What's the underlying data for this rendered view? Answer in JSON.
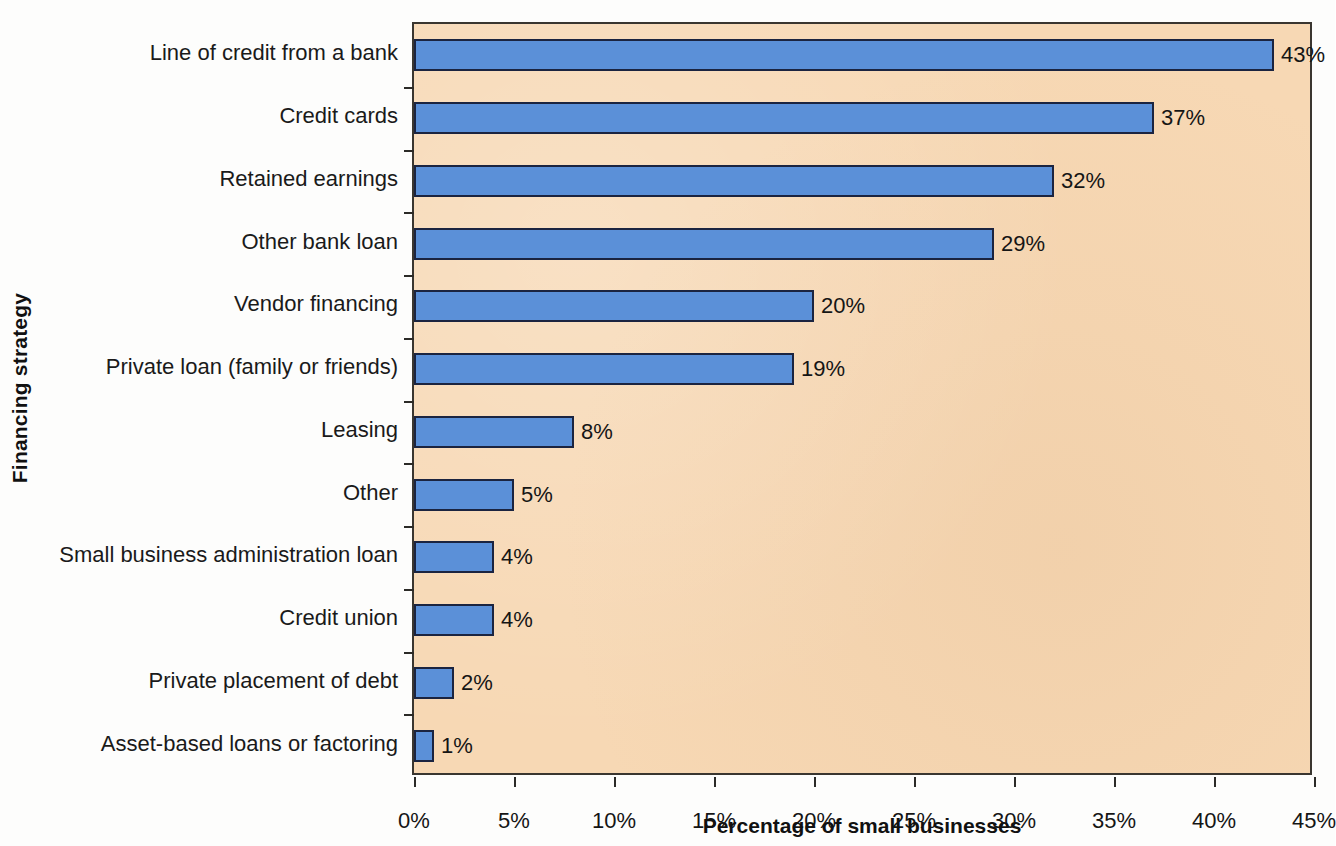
{
  "chart_data": {
    "type": "bar",
    "orientation": "horizontal",
    "title": "",
    "xlabel": "Percentage of small businesses",
    "ylabel": "Financing strategy",
    "categories": [
      "Line of credit from a bank",
      "Credit cards",
      "Retained earnings",
      "Other bank loan",
      "Vendor financing",
      "Private loan (family or friends)",
      "Leasing",
      "Other",
      "Small business administration loan",
      "Credit union",
      "Private placement of debt",
      "Asset-based loans or factoring"
    ],
    "values": [
      43,
      37,
      32,
      29,
      20,
      19,
      8,
      5,
      4,
      4,
      2,
      1
    ],
    "value_labels": [
      "43%",
      "37%",
      "32%",
      "29%",
      "20%",
      "19%",
      "8%",
      "5%",
      "4%",
      "4%",
      "2%",
      "1%"
    ],
    "xlim": [
      0,
      45
    ],
    "xticks": [
      0,
      5,
      10,
      15,
      20,
      25,
      30,
      35,
      40,
      45
    ],
    "xtick_labels": [
      "0%",
      "5%",
      "10%",
      "15%",
      "20%",
      "25%",
      "30%",
      "35%",
      "40%",
      "45%"
    ],
    "grid": false,
    "legend": null,
    "colors": {
      "bar_fill": "#5b90d8",
      "bar_edge": "#1b2440",
      "plot_background": "#f7d8b4",
      "axis": "#2b2a27",
      "text": "#151515",
      "figure_background": "#fdfdfc"
    }
  }
}
